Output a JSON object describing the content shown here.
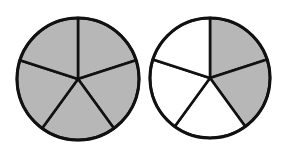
{
  "title": "Fraction circles",
  "colors": {
    "shaded": "#b7b7b7",
    "unshaded": "#ffffff",
    "stroke": "#111111"
  },
  "circles": [
    {
      "label": "Circle 1",
      "cx": 78,
      "cy": 79,
      "r": 61,
      "parts": 5,
      "shaded": [
        0,
        1,
        2,
        3,
        4
      ],
      "fraction": "5/5"
    },
    {
      "label": "Circle 2",
      "cx": 210,
      "cy": 78,
      "r": 60,
      "parts": 5,
      "shaded": [
        0,
        1
      ],
      "fraction": "2/5"
    }
  ]
}
